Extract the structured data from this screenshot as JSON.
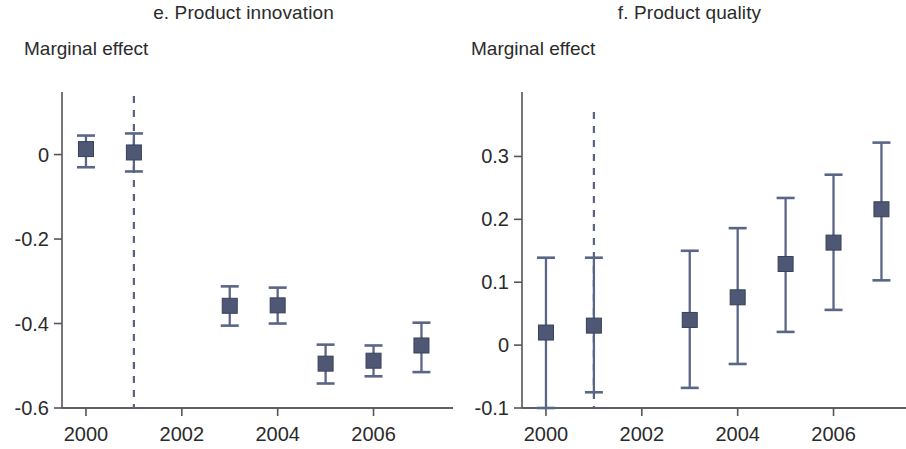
{
  "figure": {
    "axis_title": "Marginal effect",
    "marker_color": "#4e5875",
    "ci_color": "#5b6687",
    "reference_line_color": "#5a6280",
    "axis_color": "#55555a"
  },
  "panels": [
    {
      "id": "panel-e",
      "title": "e. Product innovation",
      "axis_title": "Marginal effect"
    },
    {
      "id": "panel-f",
      "title": "f. Product quality",
      "axis_title": "Marginal effect"
    }
  ],
  "chart_data": [
    {
      "type": "scatter",
      "title": "e. Product innovation",
      "xlabel": "",
      "ylabel": "Marginal effect",
      "xlim": [
        1999.5,
        2007.7
      ],
      "ylim": [
        -0.6,
        0.07
      ],
      "grid": false,
      "legend": null,
      "xticks": [
        2000,
        2002,
        2004,
        2006
      ],
      "xtick_labels": [
        "2000",
        "2002",
        "2004",
        "2006"
      ],
      "yticks": [
        0,
        -0.2,
        -0.4,
        -0.6
      ],
      "ytick_labels": [
        "0",
        "-0.2",
        "-0.4",
        "-0.6"
      ],
      "reference_line_x": 2001,
      "x": [
        2000,
        2001,
        2003,
        2004,
        2005,
        2006,
        2007
      ],
      "values": [
        0.013,
        0.005,
        -0.358,
        -0.357,
        -0.495,
        -0.488,
        -0.452
      ],
      "ci_low": [
        -0.03,
        -0.04,
        -0.405,
        -0.4,
        -0.542,
        -0.525,
        -0.515
      ],
      "ci_high": [
        0.045,
        0.05,
        -0.312,
        -0.315,
        -0.45,
        -0.452,
        -0.398
      ],
      "point_labels": [
        "2000",
        "2001",
        "2003",
        "2004",
        "2005",
        "2006",
        "2007"
      ]
    },
    {
      "type": "scatter",
      "title": "f. Product quality",
      "xlabel": "",
      "ylabel": "Marginal effect",
      "xlim": [
        1999.5,
        2007.7
      ],
      "ylim": [
        -0.1,
        0.35
      ],
      "grid": false,
      "legend": null,
      "xticks": [
        2000,
        2002,
        2004,
        2006
      ],
      "xtick_labels": [
        "2000",
        "2002",
        "2004",
        "2006"
      ],
      "yticks": [
        0.3,
        0.2,
        0.1,
        0,
        -0.1
      ],
      "ytick_labels": [
        "0.3",
        "0.2",
        "0.1",
        "0",
        "-0.1"
      ],
      "reference_line_x": 2001,
      "x": [
        2000,
        2001,
        2003,
        2004,
        2005,
        2006,
        2007
      ],
      "values": [
        0.02,
        0.031,
        0.04,
        0.076,
        0.129,
        0.163,
        0.216
      ],
      "ci_low": [
        -0.1,
        -0.075,
        -0.068,
        -0.03,
        0.021,
        0.056,
        0.103
      ],
      "ci_high": [
        0.139,
        0.139,
        0.15,
        0.186,
        0.234,
        0.271,
        0.322
      ],
      "point_labels": [
        "2000",
        "2001",
        "2003",
        "2004",
        "2005",
        "2006",
        "2007"
      ]
    }
  ]
}
